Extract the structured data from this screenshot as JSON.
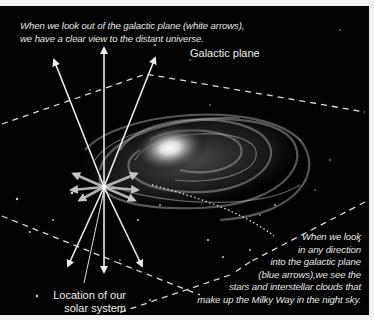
{
  "captions": {
    "top_line1": "When we look out of the galactic plane (white arrows),",
    "top_line2": "we have a clear view to the distant universe.",
    "right_lines": [
      "When we look",
      "in any direction",
      "into the galactic plane",
      "(blue arrows),we see the",
      "stars and interstellar clouds that",
      "make up the Milky Way in the night sky."
    ]
  },
  "labels": {
    "galactic_plane": "Galactic plane",
    "location_line1": "Location of our",
    "location_line2": "solar system"
  },
  "colors": {
    "background": "#020202",
    "page": "#f2f2f2",
    "white_arrows": "#ececec",
    "in_plane_arrows": "#bdbdbd",
    "text": "#e6e6e6"
  }
}
